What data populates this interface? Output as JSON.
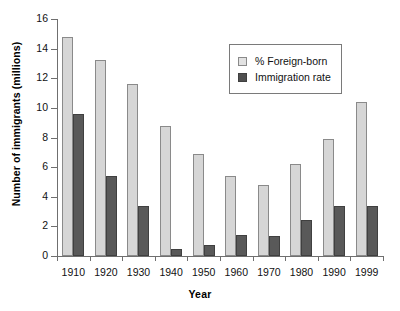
{
  "chart_data": {
    "type": "bar",
    "title": "",
    "xlabel": "Year",
    "ylabel": "Number of immigrants (millions)",
    "categories": [
      "1910",
      "1920",
      "1930",
      "1940",
      "1950",
      "1960",
      "1970",
      "1980",
      "1990",
      "1999"
    ],
    "ylim": [
      0,
      16
    ],
    "yticks": [
      0,
      2,
      4,
      6,
      8,
      10,
      12,
      14,
      16
    ],
    "ytick_labels": [
      "0",
      "2",
      "4",
      "6",
      "8",
      "10",
      "12",
      "14",
      "16"
    ],
    "grid": false,
    "legend_position": "upper-right-inside",
    "series": [
      {
        "name": "% Foreign-born",
        "color": "#d6d6d6",
        "border_color": "#8a8a8a",
        "values": [
          14.8,
          13.2,
          11.6,
          8.8,
          6.9,
          5.4,
          4.8,
          6.2,
          7.9,
          10.4
        ]
      },
      {
        "name": "Immigration rate",
        "color": "#595959",
        "border_color": "#404040",
        "values": [
          9.6,
          5.4,
          3.4,
          0.45,
          0.75,
          1.4,
          1.35,
          2.45,
          3.4,
          3.4
        ]
      }
    ]
  },
  "legend": {
    "items": [
      {
        "label": "% Foreign-born",
        "swatch": "light"
      },
      {
        "label": "Immigration rate",
        "swatch": "dark"
      }
    ]
  }
}
